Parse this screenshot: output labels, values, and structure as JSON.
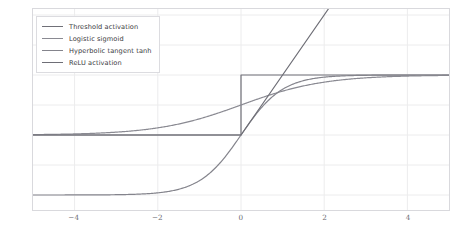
{
  "chart_data": {
    "type": "line",
    "title": "",
    "subtitle": "",
    "xlabel": "",
    "ylabel": "",
    "xlim": [
      -5.0,
      5.0
    ],
    "ylim": [
      -1.25,
      2.1
    ],
    "xticks": [
      "-4",
      "-2",
      "0",
      "2",
      "4"
    ],
    "xtick_values": [
      -4,
      -2,
      0,
      2,
      4
    ],
    "yticks": [
      "2.0",
      "1.5",
      "1.0",
      "0.5",
      "0.0",
      "-0.5",
      "-1.0"
    ],
    "ytick_values": [
      2.0,
      1.5,
      1.0,
      0.5,
      0.0,
      -0.5,
      -1.0
    ],
    "grid": true,
    "grid_color": "#ececed",
    "background": "#ffffff",
    "legend_position": "upper-left",
    "series": [
      {
        "name": "Threshold activation",
        "color": "#707078",
        "formula": "step",
        "description": "0 for x<0, 1 for x>=0",
        "x": [
          -5,
          -4,
          -3,
          -2,
          -1,
          -0.001,
          0,
          0.001,
          1,
          2,
          3,
          4,
          5
        ],
        "values": [
          0,
          0,
          0,
          0,
          0,
          0,
          1,
          1,
          1,
          1,
          1,
          1,
          1
        ]
      },
      {
        "name": "Logistic sigmoid",
        "color": "#8a8a92",
        "formula": "1/(1+exp(-x))",
        "description": "smooth S-curve from 0 to 1",
        "x": [
          -5,
          -4,
          -3,
          -2,
          -1,
          0,
          1,
          2,
          3,
          4,
          5
        ],
        "values": [
          0.0067,
          0.018,
          0.047,
          0.119,
          0.269,
          0.5,
          0.731,
          0.881,
          0.953,
          0.982,
          0.993
        ]
      },
      {
        "name": "Hyperbolic tangent tanh",
        "color": "#84848c",
        "formula": "tanh(x)",
        "description": "smooth S-curve from -1 to 1",
        "x": [
          -5,
          -4,
          -3,
          -2,
          -1,
          0,
          1,
          2,
          3,
          4,
          5
        ],
        "values": [
          -0.9999,
          -0.9993,
          -0.995,
          -0.964,
          -0.762,
          0,
          0.762,
          0.964,
          0.995,
          0.9993,
          0.9999
        ]
      },
      {
        "name": "ReLU activation",
        "color": "#6e6e76",
        "formula": "max(0, x)",
        "description": "0 for x<0, x for x>=0, exits top of axes near x=2.1",
        "x": [
          -5,
          -2,
          0,
          1,
          2,
          2.1
        ],
        "values": [
          0,
          0,
          0,
          1,
          2,
          2.1
        ]
      }
    ]
  },
  "legend": {
    "items": [
      {
        "label": "Threshold activation",
        "color": "#707078"
      },
      {
        "label": "Logistic sigmoid",
        "color": "#8a8a92"
      },
      {
        "label": "Hyperbolic tangent tanh",
        "color": "#84848c"
      },
      {
        "label": "ReLU activation",
        "color": "#6e6e76"
      }
    ]
  }
}
